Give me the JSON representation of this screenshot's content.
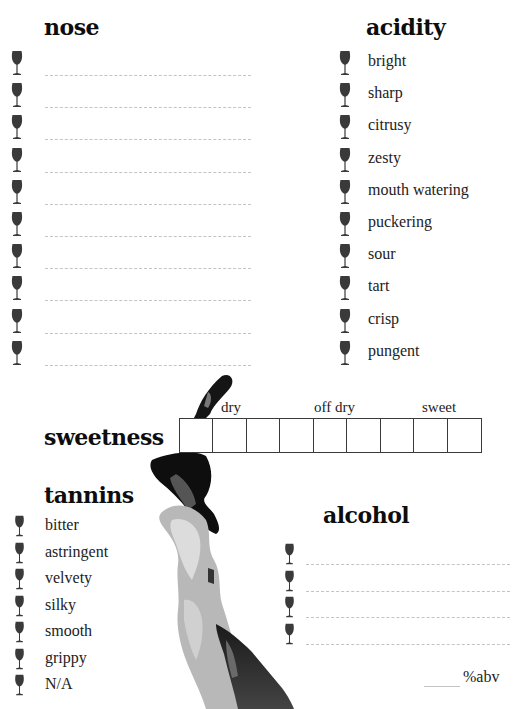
{
  "nose": {
    "title": "nose",
    "lines": 10
  },
  "acidity": {
    "title": "acidity",
    "items": [
      "bright",
      "sharp",
      "citrusy",
      "zesty",
      "mouth watering",
      "puckering",
      "sour",
      "tart",
      "crisp",
      "pungent"
    ]
  },
  "sweetness": {
    "title": "sweetness",
    "scale_labels": [
      "dry",
      "off dry",
      "sweet"
    ],
    "boxes": 9
  },
  "tannins": {
    "title": "tannins",
    "items": [
      "bitter",
      "astringent",
      "velvety",
      "silky",
      "smooth",
      "grippy",
      "N/A"
    ]
  },
  "alcohol": {
    "title": "alcohol",
    "lines": 4,
    "abv_label": "%abv"
  },
  "icons": {
    "bullet": "wine-glass-icon",
    "decoration": "watercolor-ink-stain"
  },
  "colors": {
    "glass": "#3a3a3a",
    "dashed_line": "#c4c4c4",
    "box_border": "#3a3a3a"
  }
}
